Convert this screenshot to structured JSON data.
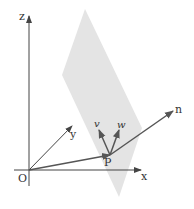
{
  "diagram": {
    "colors": {
      "plane": "#e4e4e4",
      "axis": "#444444",
      "vector": "#555555",
      "text": "#333333"
    },
    "axes": {
      "origin_label": "O",
      "x_label": "x",
      "y_label": "y",
      "z_label": "z"
    },
    "point": {
      "label": "P"
    },
    "vectors": {
      "v_label": "v",
      "w_label": "w",
      "n_label": "n"
    }
  }
}
